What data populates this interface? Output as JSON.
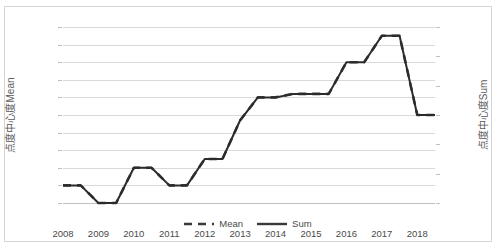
{
  "chart_data": {
    "type": "line",
    "title": "",
    "xlabel": "",
    "ylabel": "点度中心度Mean",
    "ylabel_secondary": "点度中心度Sum",
    "grid": true,
    "legend_position": "bottom",
    "x": [
      2008,
      2008.5,
      2009,
      2009.5,
      2010,
      2010.5,
      2011,
      2011.5,
      2012,
      2012.5,
      2013,
      2013.5,
      2014,
      2014.5,
      2015,
      2015.5,
      2016,
      2016.5,
      2017,
      2017.5,
      2018,
      2018.5
    ],
    "xtick_labels": [
      "2008",
      "2009",
      "2010",
      "2011",
      "2012",
      "2013",
      "2014",
      "2015",
      "2016",
      "2017",
      "2018"
    ],
    "xlim": [
      2008,
      2018.5
    ],
    "ylim": [
      0,
      10
    ],
    "ytick_labels": [
      "0",
      "1",
      "2",
      "3",
      "4",
      "5",
      "6",
      "7",
      "8",
      "9",
      "10"
    ],
    "ylim_secondary": [
      0,
      600
    ],
    "ytick_labels_secondary": [
      "0",
      "100",
      "200",
      "300",
      "400",
      "500",
      "600"
    ],
    "series": [
      {
        "name": "Mean",
        "style": "dashed",
        "color": "#3a3a3a",
        "axis": "left",
        "values": [
          1.0,
          1.0,
          0.0,
          0.0,
          2.0,
          2.0,
          1.0,
          1.0,
          2.5,
          2.5,
          4.7,
          6.0,
          6.0,
          6.2,
          6.2,
          6.2,
          8.0,
          8.0,
          9.5,
          9.5,
          5.0,
          5.0
        ]
      },
      {
        "name": "Sum",
        "style": "solid",
        "color": "#2b2b2b",
        "axis": "right",
        "values": [
          60,
          60,
          0,
          0,
          120,
          120,
          60,
          60,
          150,
          150,
          282,
          360,
          360,
          372,
          372,
          372,
          480,
          480,
          570,
          570,
          300,
          300
        ]
      }
    ],
    "legend": [
      {
        "label": "Mean",
        "style": "dashed"
      },
      {
        "label": "Sum",
        "style": "solid"
      }
    ]
  }
}
